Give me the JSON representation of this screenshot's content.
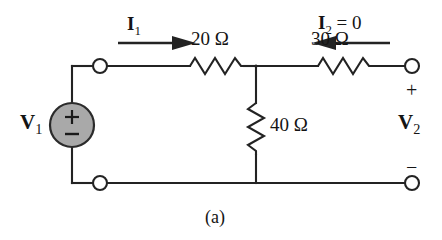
{
  "figure": {
    "caption": "(a)"
  },
  "source": {
    "label_main": "V",
    "label_sub": "1",
    "plus_sign": "+",
    "minus_sign": "−",
    "fill_color": "#a9a9a9",
    "stroke_color": "#2b2b2b"
  },
  "currents": [
    {
      "name": "input-current",
      "label_main": "I",
      "label_sub": "1",
      "label_suffix": "",
      "direction": "right"
    },
    {
      "name": "output-current",
      "label_main": "I",
      "label_sub": "2",
      "label_suffix": " = 0",
      "direction": "left"
    }
  ],
  "resistors": [
    {
      "name": "series-input-resistor",
      "value": "20",
      "unit": "Ω",
      "label": "20 Ω",
      "orientation": "horizontal"
    },
    {
      "name": "series-output-resistor",
      "value": "30",
      "unit": "Ω",
      "label": "30 Ω",
      "orientation": "horizontal"
    },
    {
      "name": "shunt-resistor",
      "value": "40",
      "unit": "Ω",
      "label": "40 Ω",
      "orientation": "vertical"
    }
  ],
  "output_port": {
    "label_main": "V",
    "label_sub": "2",
    "plus_sign": "+",
    "minus_sign": "−"
  },
  "colors": {
    "wire": "#232323",
    "text": "#141414",
    "background": "#ffffff",
    "source_fill": "#a9a9a9"
  }
}
